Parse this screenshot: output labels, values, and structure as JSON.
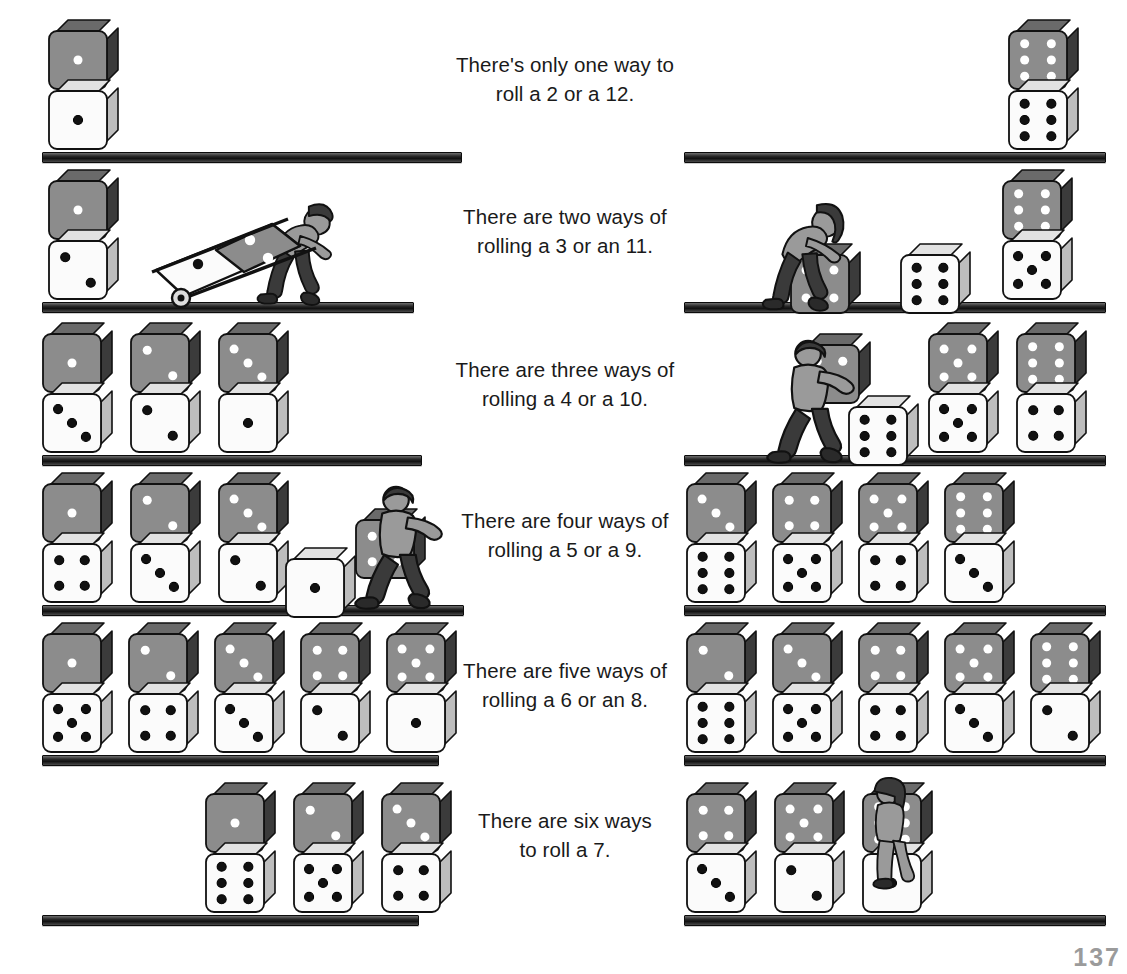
{
  "page": {
    "page_number": "137",
    "colors": {
      "gray_die_face": "#8c8c8c",
      "gray_die_side": "#3b3b3b",
      "gray_die_top": "#6a6a6a",
      "white_die_face": "#fbfbfb",
      "white_die_side": "#bdbdbd",
      "pip_light": "#ffffff",
      "pip_dark": "#111111",
      "shelf": "#1a1a1a",
      "text": "#1a1a1a",
      "figure_skin": "#9a9a9a",
      "figure_dark": "#3a3a3a"
    }
  },
  "rows": [
    {
      "id": "row-2-12",
      "caption_lines": [
        "There's only one way to",
        "roll a 2 or a 12."
      ],
      "ways": 1,
      "sums": [
        2,
        12
      ],
      "left": {
        "sum": 2,
        "stacks": [
          {
            "gray": 1,
            "white": 1
          }
        ],
        "figure": null
      },
      "right": {
        "sum": 12,
        "stacks": [
          {
            "gray": 6,
            "white": 6
          }
        ],
        "figure": null
      }
    },
    {
      "id": "row-3-11",
      "caption_lines": [
        "There are two ways of",
        "rolling a 3 or an 11."
      ],
      "ways": 2,
      "sums": [
        3,
        11
      ],
      "left": {
        "sum": 3,
        "stacks": [
          {
            "gray": 1,
            "white": 2
          }
        ],
        "figure": {
          "kind": "hand-truck-boy",
          "carrying": {
            "white": 1,
            "gray": 2
          }
        }
      },
      "right": {
        "sum": 11,
        "stacks": [
          {
            "gray": 6,
            "white": 5
          }
        ],
        "figure": {
          "kind": "pushing-girl",
          "pushing": {
            "gray": 5,
            "white": 6
          }
        }
      }
    },
    {
      "id": "row-4-10",
      "caption_lines": [
        "There are three ways of",
        "rolling a 4 or a 10."
      ],
      "ways": 3,
      "sums": [
        4,
        10
      ],
      "left": {
        "sum": 4,
        "stacks": [
          {
            "gray": 1,
            "white": 3
          },
          {
            "gray": 2,
            "white": 2
          },
          {
            "gray": 3,
            "white": 1
          }
        ],
        "figure": null
      },
      "right": {
        "sum": 10,
        "stacks": [
          {
            "gray": 5,
            "white": 5
          },
          {
            "gray": 6,
            "white": 4
          }
        ],
        "figure": {
          "kind": "lifting-boy",
          "carrying": {
            "gray": 4
          },
          "below": {
            "white": 6
          }
        }
      }
    },
    {
      "id": "row-5-9",
      "caption_lines": [
        "There are four ways of",
        "rolling a 5 or a 9."
      ],
      "ways": 4,
      "sums": [
        5,
        9
      ],
      "left": {
        "sum": 5,
        "stacks": [
          {
            "gray": 1,
            "white": 4
          },
          {
            "gray": 2,
            "white": 3
          },
          {
            "gray": 3,
            "white": 2
          }
        ],
        "figure": {
          "kind": "carrying-boy",
          "carrying": {
            "gray": 4
          },
          "below": {
            "white": 1
          }
        }
      },
      "right": {
        "sum": 9,
        "stacks": [
          {
            "gray": 3,
            "white": 6
          },
          {
            "gray": 4,
            "white": 5
          },
          {
            "gray": 5,
            "white": 4
          },
          {
            "gray": 6,
            "white": 3
          }
        ],
        "figure": null
      }
    },
    {
      "id": "row-6-8",
      "caption_lines": [
        "There are five ways of",
        "rolling a 6 or an 8."
      ],
      "ways": 5,
      "sums": [
        6,
        8
      ],
      "left": {
        "sum": 6,
        "stacks": [
          {
            "gray": 1,
            "white": 5
          },
          {
            "gray": 2,
            "white": 4
          },
          {
            "gray": 3,
            "white": 3
          },
          {
            "gray": 4,
            "white": 2
          },
          {
            "gray": 5,
            "white": 1
          }
        ],
        "figure": null
      },
      "right": {
        "sum": 8,
        "stacks": [
          {
            "gray": 2,
            "white": 6
          },
          {
            "gray": 3,
            "white": 5
          },
          {
            "gray": 4,
            "white": 4
          },
          {
            "gray": 5,
            "white": 3
          },
          {
            "gray": 6,
            "white": 2
          }
        ],
        "figure": null
      }
    },
    {
      "id": "row-7",
      "caption_lines": [
        "There are six ways",
        "to roll a 7."
      ],
      "ways": 6,
      "sums": [
        7
      ],
      "left": {
        "sum": 7,
        "stacks": [
          {
            "gray": 1,
            "white": 6
          },
          {
            "gray": 2,
            "white": 5
          },
          {
            "gray": 3,
            "white": 4
          }
        ],
        "figure": null
      },
      "right": {
        "sum": 7,
        "stacks": [
          {
            "gray": 4,
            "white": 3
          },
          {
            "gray": 5,
            "white": 2
          },
          {
            "gray": 6,
            "white": 1
          }
        ],
        "figure": {
          "kind": "standing-girl"
        }
      }
    }
  ]
}
